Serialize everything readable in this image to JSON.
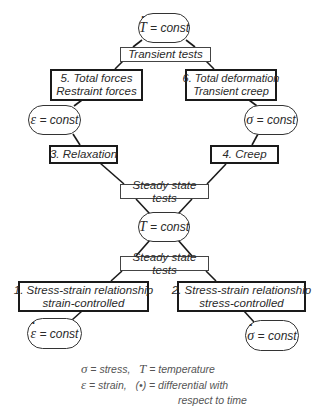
{
  "diagram": {
    "type": "test-classification-tree",
    "colors": {
      "line": "#1a1a1a",
      "text": "#2a2a2a",
      "legend_text": "#555555",
      "background": "#ffffff"
    },
    "nodes": {
      "top_condition": {
        "symbol": "T",
        "dotted": true,
        "text": "= const"
      },
      "transient_label": {
        "text": "Transient tests"
      },
      "box5": {
        "line1": "5.  Total forces",
        "line2": "Restraint forces"
      },
      "box6": {
        "line1": "6. Total deformation",
        "line2": "Transient creep"
      },
      "eps_condition": {
        "symbol": "ε",
        "dotted": false,
        "text": "= const"
      },
      "sigma_condition": {
        "symbol": "σ",
        "dotted": false,
        "text": "= const"
      },
      "box3": {
        "line1": "3.  Relaxation"
      },
      "box4": {
        "line1": "4.  Creep"
      },
      "steady_label_1": {
        "text": "Steady state tests"
      },
      "t_condition": {
        "symbol": "T",
        "dotted": false,
        "text": "= const"
      },
      "steady_label_2": {
        "text": "Steady state tests"
      },
      "box1": {
        "line1": "1. Stress-strain relationship",
        "line2": "strain-controlled"
      },
      "box2": {
        "line1": "2.  Stress-strain relationship",
        "line2": "stress-controlled"
      },
      "eps_dot_condition": {
        "symbol": "ε",
        "dotted": true,
        "text": "= const"
      },
      "sigma_dot_condition": {
        "symbol": "σ",
        "dotted": true,
        "text": "= const"
      }
    },
    "legend": {
      "line1": {
        "sym1": "σ",
        "def1": "= stress,",
        "sym2": "T",
        "def2": "=  temperature"
      },
      "line2": {
        "sym1": "ε",
        "def1": "= strain,",
        "sym2": "(•)",
        "def2": "=  differential with"
      },
      "line3": "respect to time"
    }
  }
}
